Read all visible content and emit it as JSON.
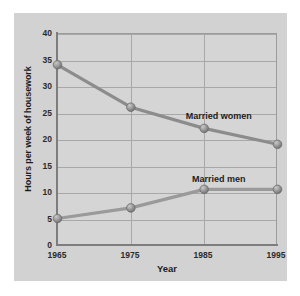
{
  "chart_data": {
    "type": "line",
    "title": "",
    "xlabel": "Year",
    "ylabel": "Hours per week of housework",
    "x": [
      1965,
      1975,
      1985,
      1995
    ],
    "categories": [
      "1965",
      "1975",
      "1985",
      "1995"
    ],
    "xlim": [
      1965,
      1995
    ],
    "ylim": [
      0,
      40
    ],
    "yticks": [
      "0",
      "5",
      "10",
      "15",
      "20",
      "25",
      "30",
      "35",
      "40"
    ],
    "ytick_values": [
      0,
      5,
      10,
      15,
      20,
      25,
      30,
      35,
      40
    ],
    "grid": true,
    "legend_position": "inline-annotation",
    "series": [
      {
        "name": "Married women",
        "values": [
          34,
          26,
          22,
          19
        ],
        "color": "#8c8c8c",
        "label_x": 1987.0,
        "label_y": 24.2
      },
      {
        "name": "Married men",
        "values": [
          5,
          7,
          10.5,
          10.5
        ],
        "color": "#9a9a9a",
        "label_x": 1987.0,
        "label_y": 12.3
      }
    ]
  },
  "style": {
    "page_background": "#ffffff",
    "panel_background": "#d2d2d2",
    "plot_background": "#d5d5d5",
    "grid_color": "#a8a8a8",
    "axis_color": "#7d7d7d",
    "line_color": "#8c8c8c",
    "marker_color": "#8f8f8f",
    "text_color": "#1d1d1d"
  }
}
